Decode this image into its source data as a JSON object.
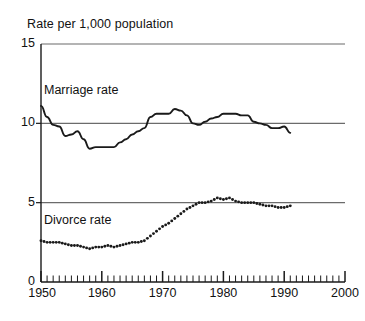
{
  "chart_data": {
    "type": "line",
    "title": "Rate per 1,000 population",
    "xlabel": "",
    "ylabel": "Rate per 1,000 population",
    "xlim": [
      1950,
      2000
    ],
    "ylim": [
      0,
      15
    ],
    "y_ticks": [
      0,
      5,
      10,
      15
    ],
    "y_tick_labels": [
      "0",
      "5",
      "10",
      "15"
    ],
    "x_ticks": [
      1950,
      1960,
      1970,
      1980,
      1990,
      2000
    ],
    "x_tick_labels": [
      "1950",
      "1960",
      "1970",
      "1980",
      "1990",
      "2000"
    ],
    "x_minor_tick_interval": 1,
    "grid": "horizontal-only",
    "legend": "inline-annotations",
    "series": [
      {
        "name": "Marriage rate",
        "style": "solid-line",
        "color": "#1a1a1a",
        "x": [
          1950,
          1951,
          1952,
          1953,
          1954,
          1955,
          1956,
          1957,
          1958,
          1959,
          1960,
          1961,
          1962,
          1963,
          1964,
          1965,
          1966,
          1967,
          1968,
          1969,
          1970,
          1971,
          1972,
          1973,
          1974,
          1975,
          1976,
          1977,
          1978,
          1979,
          1980,
          1981,
          1982,
          1983,
          1984,
          1985,
          1986,
          1987,
          1988,
          1989,
          1990,
          1991
        ],
        "values": [
          11.1,
          10.4,
          9.9,
          9.8,
          9.2,
          9.3,
          9.5,
          9.0,
          8.4,
          8.5,
          8.5,
          8.5,
          8.5,
          8.8,
          9.0,
          9.3,
          9.5,
          9.7,
          10.4,
          10.6,
          10.6,
          10.6,
          10.9,
          10.8,
          10.5,
          10.0,
          9.9,
          10.1,
          10.3,
          10.4,
          10.6,
          10.6,
          10.6,
          10.5,
          10.5,
          10.1,
          10.0,
          9.9,
          9.7,
          9.7,
          9.8,
          9.4
        ]
      },
      {
        "name": "Divorce rate",
        "style": "dotted",
        "color": "#1a1a1a",
        "x": [
          1950,
          1951,
          1952,
          1953,
          1954,
          1955,
          1956,
          1957,
          1958,
          1959,
          1960,
          1961,
          1962,
          1963,
          1964,
          1965,
          1966,
          1967,
          1968,
          1969,
          1970,
          1971,
          1972,
          1973,
          1974,
          1975,
          1976,
          1977,
          1978,
          1979,
          1980,
          1981,
          1982,
          1983,
          1984,
          1985,
          1986,
          1987,
          1988,
          1989,
          1990,
          1991
        ],
        "values": [
          2.6,
          2.5,
          2.5,
          2.5,
          2.4,
          2.3,
          2.3,
          2.2,
          2.1,
          2.2,
          2.2,
          2.3,
          2.2,
          2.3,
          2.4,
          2.5,
          2.5,
          2.6,
          2.9,
          3.2,
          3.5,
          3.7,
          4.0,
          4.3,
          4.6,
          4.8,
          5.0,
          5.0,
          5.1,
          5.3,
          5.2,
          5.3,
          5.1,
          5.0,
          5.0,
          5.0,
          4.9,
          4.8,
          4.8,
          4.7,
          4.7,
          4.8
        ]
      }
    ],
    "annotations": [
      {
        "text": "Marriage rate",
        "x": 1952,
        "y": 11.7
      },
      {
        "text": "Divorce rate",
        "x": 1952,
        "y": 3.6
      }
    ]
  }
}
